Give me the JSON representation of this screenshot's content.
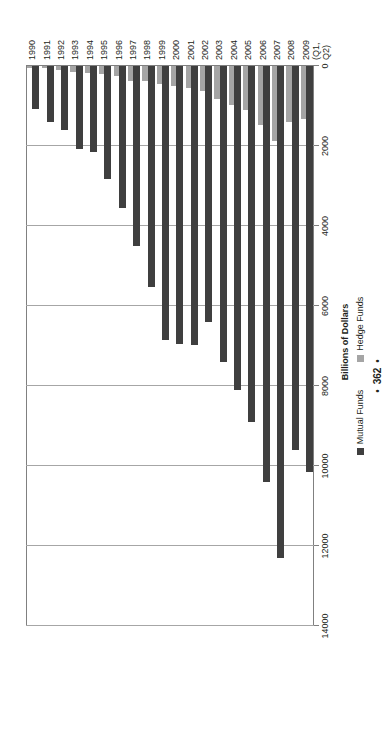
{
  "page": {
    "number": "362",
    "dot_left": "•",
    "dot_right": "•"
  },
  "chart_data": {
    "type": "bar",
    "orientation": "vertical",
    "title": "",
    "xlabel": "",
    "ylabel": "Billions of Dollars",
    "ylim": [
      0,
      14000
    ],
    "ytick_values": [
      0,
      2000,
      4000,
      6000,
      8000,
      10000,
      12000,
      14000
    ],
    "ytick_labels": [
      "0",
      "2000",
      "4000",
      "6000",
      "8000",
      "10000",
      "12000",
      "14000"
    ],
    "grid": true,
    "legend_position": "bottom",
    "categories": [
      "1990",
      "1991",
      "1992",
      "1993",
      "1994",
      "1995",
      "1996",
      "1997",
      "1998",
      "1999",
      "2000",
      "2001",
      "2002",
      "2003",
      "2004",
      "2005",
      "2006",
      "2007",
      "2008",
      "2009\n(Q1,\nQ2)"
    ],
    "category_labels": [
      {
        "line1": "1990",
        "line2": "",
        "line3": ""
      },
      {
        "line1": "1991",
        "line2": "",
        "line3": ""
      },
      {
        "line1": "1992",
        "line2": "",
        "line3": ""
      },
      {
        "line1": "1993",
        "line2": "",
        "line3": ""
      },
      {
        "line1": "1994",
        "line2": "",
        "line3": ""
      },
      {
        "line1": "1995",
        "line2": "",
        "line3": ""
      },
      {
        "line1": "1996",
        "line2": "",
        "line3": ""
      },
      {
        "line1": "1997",
        "line2": "",
        "line3": ""
      },
      {
        "line1": "1998",
        "line2": "",
        "line3": ""
      },
      {
        "line1": "1999",
        "line2": "",
        "line3": ""
      },
      {
        "line1": "2000",
        "line2": "",
        "line3": ""
      },
      {
        "line1": "2001",
        "line2": "",
        "line3": ""
      },
      {
        "line1": "2002",
        "line2": "",
        "line3": ""
      },
      {
        "line1": "2003",
        "line2": "",
        "line3": ""
      },
      {
        "line1": "2004",
        "line2": "",
        "line3": ""
      },
      {
        "line1": "2005",
        "line2": "",
        "line3": ""
      },
      {
        "line1": "2006",
        "line2": "",
        "line3": ""
      },
      {
        "line1": "2007",
        "line2": "",
        "line3": ""
      },
      {
        "line1": "2008",
        "line2": "",
        "line3": ""
      },
      {
        "line1": "2009",
        "line2": "(Q1,",
        "line3": "Q2)"
      }
    ],
    "series": [
      {
        "name": "Mutual Funds",
        "color": "#3f3f3f",
        "values": [
          1065,
          1390,
          1600,
          2075,
          2155,
          2820,
          3540,
          4490,
          5530,
          6850,
          6960,
          6980,
          6390,
          7410,
          8100,
          8890,
          10400,
          12300,
          9600,
          10150
        ]
      },
      {
        "name": "Hedge Funds",
        "color": "#a5a5a5",
        "values": [
          40,
          60,
          95,
          145,
          170,
          190,
          260,
          375,
          375,
          460,
          490,
          560,
          625,
          820,
          975,
          1105,
          1465,
          1870,
          1400,
          1330
        ]
      }
    ],
    "legend": [
      {
        "label": "Mutual Funds",
        "color": "#3f3f3f"
      },
      {
        "label": "Hedge Funds",
        "color": "#a5a5a5"
      }
    ]
  }
}
